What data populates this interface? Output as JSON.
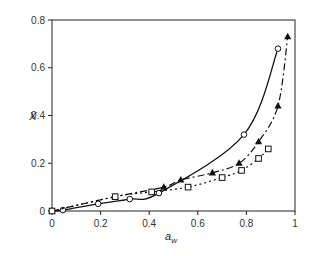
{
  "chart_data": {
    "type": "line",
    "title": "",
    "xlabel": "a_w",
    "ylabel": "X",
    "xlim": [
      0,
      1
    ],
    "ylim": [
      0,
      0.8
    ],
    "xticks": [
      "0",
      "0.2",
      "0.4",
      "0.6",
      "0.8",
      "1"
    ],
    "yticks": [
      "0",
      "0.2",
      "0.4",
      "0.6",
      "0.8"
    ],
    "grid": false,
    "legend": null,
    "series": [
      {
        "name": "circles",
        "marker": "open-circle",
        "line": "solid",
        "x": [
          0,
          0.045,
          0.19,
          0.32,
          0.44,
          0.79,
          0.93
        ],
        "y": [
          0,
          0.004,
          0.03,
          0.05,
          0.075,
          0.32,
          0.68
        ]
      },
      {
        "name": "triangles",
        "marker": "filled-triangle",
        "line": "dash-dot",
        "x": [
          0,
          0.26,
          0.46,
          0.53,
          0.66,
          0.77,
          0.85,
          0.93,
          0.97
        ],
        "y": [
          0,
          0.06,
          0.1,
          0.13,
          0.16,
          0.2,
          0.29,
          0.44,
          0.73
        ]
      },
      {
        "name": "squares",
        "marker": "open-square",
        "line": "dotted",
        "x": [
          0,
          0.26,
          0.41,
          0.56,
          0.7,
          0.78,
          0.85,
          0.89
        ],
        "y": [
          0,
          0.06,
          0.08,
          0.1,
          0.14,
          0.17,
          0.22,
          0.26
        ]
      }
    ]
  }
}
